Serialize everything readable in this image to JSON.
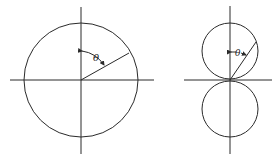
{
  "figures": [
    {
      "name": "circular-pattern",
      "angle_label": "θ",
      "axes": {
        "center": [
          81,
          80
        ]
      },
      "circles": [
        {
          "cx": 81,
          "cy": 80,
          "r": 57
        }
      ]
    },
    {
      "name": "figure-eight-pattern",
      "angle_label": "θ",
      "axes": {
        "center": [
          230,
          80
        ]
      },
      "circles": [
        {
          "cx": 230,
          "cy": 51,
          "r": 28
        },
        {
          "cx": 230,
          "cy": 109,
          "r": 28
        }
      ]
    }
  ]
}
